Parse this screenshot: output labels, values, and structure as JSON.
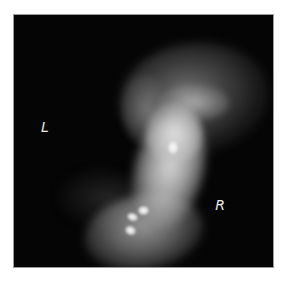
{
  "image": {
    "kind": "grayscale medical scan",
    "background": "#ffffff",
    "panel_color": "#050505",
    "orientation_markers": {
      "left": "L",
      "right": "R"
    }
  }
}
